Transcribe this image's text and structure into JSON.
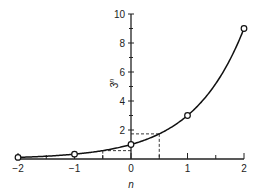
{
  "chart_data": {
    "type": "line",
    "title": "",
    "xlabel": "n",
    "ylabel": "3^n",
    "xlim": [
      -2,
      2
    ],
    "ylim": [
      0,
      10
    ],
    "grid": false,
    "x_ticks": [
      -2,
      -1,
      0,
      1,
      2
    ],
    "x_tick_labels": [
      "−2",
      "−1",
      "0",
      "1",
      "2"
    ],
    "x_minor_ticks": [
      -1.5,
      -0.5,
      0.5,
      1.5
    ],
    "y_ticks": [
      2,
      4,
      6,
      8,
      10
    ],
    "y_tick_labels": [
      "2",
      "4",
      "6",
      "8",
      "10"
    ],
    "y_minor_ticks": [
      1,
      3,
      5,
      7,
      9
    ],
    "series": [
      {
        "name": "3^n",
        "curve": "continuous exponential y = 3^n",
        "markers": [
          {
            "x": -2,
            "y": 0.111
          },
          {
            "x": -1,
            "y": 0.333
          },
          {
            "x": 0,
            "y": 1
          },
          {
            "x": 1,
            "y": 3
          },
          {
            "x": 2,
            "y": 9
          }
        ]
      }
    ],
    "annotations": [
      {
        "type": "dashed-guide",
        "x": 0.5,
        "y": 1.732
      },
      {
        "type": "dashed-guide",
        "x": -0.5,
        "y": 0.577
      }
    ]
  }
}
